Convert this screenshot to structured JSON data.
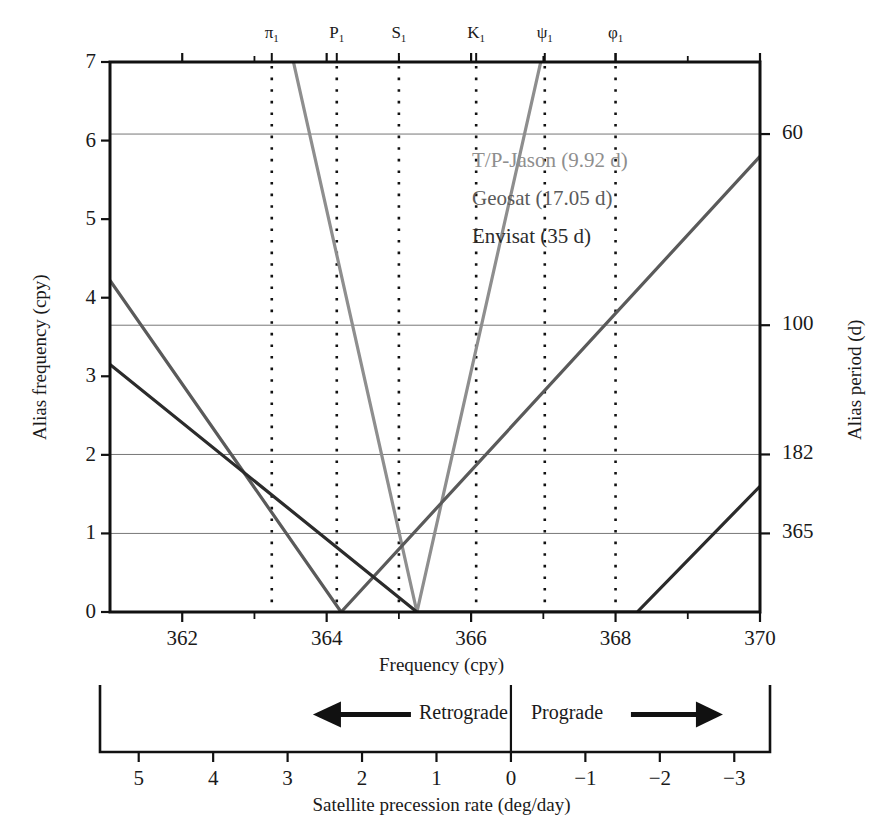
{
  "chart_data": {
    "type": "line",
    "title": "",
    "xlabel": "Frequency (cpy)",
    "ylabel": "Alias frequency (cpy)",
    "y2label": "Alias period (d)",
    "x2label": "Satellite precession rate (deg/day)",
    "xlim": [
      361.0,
      370.0
    ],
    "ylim": [
      0,
      7
    ],
    "grid": true,
    "legend_position": "upper-right-inside",
    "xticks": [
      362,
      364,
      366,
      368,
      370
    ],
    "xtick_labels": [
      "362",
      "364",
      "366",
      "368",
      "370"
    ],
    "xminor": [
      361,
      363,
      365,
      367,
      369
    ],
    "yticks": [
      0,
      1,
      2,
      3,
      4,
      5,
      6,
      7
    ],
    "ytick_labels": [
      "0",
      "1",
      "2",
      "3",
      "4",
      "5",
      "6",
      "7"
    ],
    "y2ticks_cpy": [
      6.083,
      3.65,
      2.005,
      1.0
    ],
    "y2tick_labels": [
      "60",
      "100",
      "182",
      "365"
    ],
    "gridlines_cpy": [
      1.0,
      2.005,
      3.65,
      6.083
    ],
    "precession_ticks": [
      5,
      4,
      3,
      2,
      1,
      0,
      -1,
      -2,
      -3
    ],
    "precession_tick_labels": [
      "5",
      "4",
      "3",
      "2",
      "1",
      "0",
      "−1",
      "−2",
      "−3"
    ],
    "precession_left_value": 5.52,
    "precession_right_value": -3.48,
    "direction_left_label": "Retrograde",
    "direction_right_label": "Prograde",
    "tidal_constituents": [
      {
        "name": "π",
        "sub": "1",
        "freq": 363.24
      },
      {
        "name": "P",
        "sub": "1",
        "freq": 364.14
      },
      {
        "name": "S",
        "sub": "1",
        "freq": 365.0
      },
      {
        "name": "K",
        "sub": "1",
        "freq": 366.07
      },
      {
        "name": "ψ",
        "sub": "1",
        "freq": 367.02
      },
      {
        "name": "φ",
        "sub": "1",
        "freq": 368.0
      }
    ],
    "series": [
      {
        "name": "T/P-Jason (9.92 d)",
        "period_days": 9.92,
        "color": "#8e8e8e",
        "vertex_freq": 365.25,
        "slope_cpy_per_cpy": 4.1,
        "points": [
          [
            361.0,
            17.4
          ],
          [
            363.54,
            7.0
          ],
          [
            365.25,
            0.0
          ],
          [
            366.28,
            2.06
          ],
          [
            367.0,
            5.8
          ]
        ]
      },
      {
        "name": "Geosat (17.05 d)",
        "period_days": 17.05,
        "color": "#5a5a5a",
        "vertex_freq": 364.2,
        "slope_cpy_per_cpy": 1.325,
        "points": [
          [
            361.0,
            4.22
          ],
          [
            364.2,
            0.0
          ],
          [
            366.28,
            2.06
          ],
          [
            370.0,
            5.8
          ]
        ]
      },
      {
        "name": "Envisat (35 d)",
        "period_days": 35.0,
        "color": "#2b2b2b",
        "vertex_freq": 368.3,
        "slope_cpy_per_cpy": 0.985,
        "points": [
          [
            361.0,
            3.15
          ],
          [
            365.25,
            0.0
          ],
          [
            368.3,
            0.0
          ],
          [
            370.0,
            1.6
          ]
        ]
      }
    ],
    "envisat_segments": [
      {
        "from": [
          361.0,
          3.15
        ],
        "to": [
          364.2,
          0.0
        ]
      },
      {
        "from": [
          364.2,
          0.0
        ],
        "to": [
          368.3,
          0.0
        ]
      }
    ],
    "line_paths": [
      {
        "series": "T/P-Jason (9.92 d)",
        "vertices": [
          [
            361.0,
            17.4
          ],
          [
            365.25,
            0.0
          ],
          [
            370.0,
            19.4
          ]
        ]
      },
      {
        "series": "Geosat (17.05 d)",
        "vertices": [
          [
            361.0,
            4.22
          ],
          [
            364.2,
            0.0
          ],
          [
            370.0,
            5.8
          ]
        ]
      },
      {
        "series": "Envisat (35 d)",
        "vertices": [
          [
            361.0,
            3.15
          ],
          [
            365.25,
            0.0
          ],
          [
            368.3,
            0.0
          ],
          [
            370.0,
            1.6
          ]
        ]
      }
    ]
  },
  "legend": {
    "entries": [
      {
        "label": "T/P-Jason (9.92 d)",
        "color": "#8e8e8e"
      },
      {
        "label": "Geosat (17.05 d)",
        "color": "#5a5a5a"
      },
      {
        "label": "Envisat (35 d)",
        "color": "#2b2b2b"
      }
    ]
  },
  "axes": {
    "y_title": "Alias frequency (cpy)",
    "y2_title": "Alias period (d)",
    "x_title": "Frequency (cpy)",
    "x2_title": "Satellite precession rate (deg/day)"
  }
}
